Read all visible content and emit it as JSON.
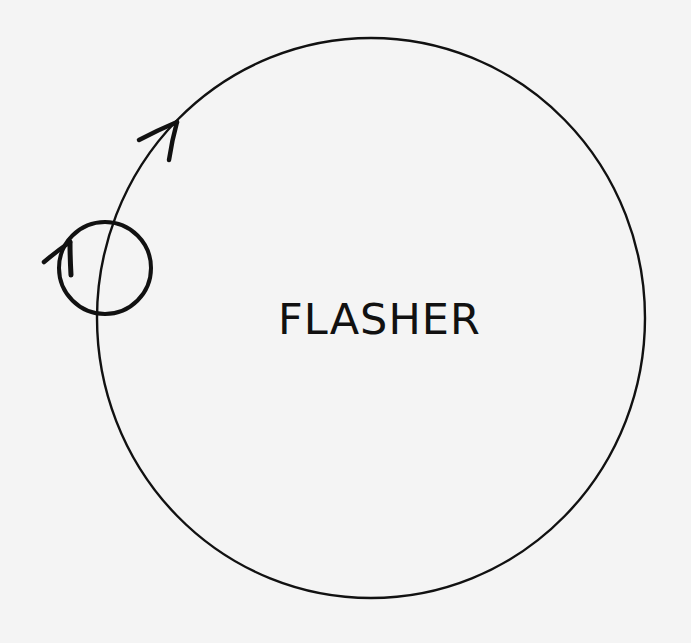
{
  "diagram": {
    "label": "FLASHER",
    "background": "#f4f4f4",
    "stroke_color": "#111111",
    "large_circle": {
      "cx": 371,
      "cy": 318,
      "rx": 274,
      "ry": 280,
      "name": "flasher-orbit"
    },
    "small_circle": {
      "cx": 105,
      "cy": 268,
      "r": 47,
      "name": "small-loop"
    },
    "arrows": [
      {
        "name": "orbit-direction-arrow",
        "tip": [
          177,
          122
        ],
        "wings": [
          [
            138,
            140
          ],
          [
            169,
            160
          ]
        ]
      },
      {
        "name": "loop-direction-arrow",
        "tip": [
          70,
          242
        ],
        "wings": [
          [
            43,
            262
          ],
          [
            71,
            275
          ]
        ]
      }
    ]
  }
}
